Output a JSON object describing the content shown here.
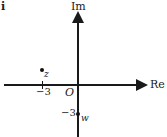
{
  "figure": {
    "part_label": "i",
    "width": 167,
    "height": 137,
    "background_color": "#ffffff",
    "ink_color": "#1a1a1a"
  },
  "axes": {
    "imaginary_label": "Im",
    "real_label": "Re",
    "origin_label": "O"
  },
  "ticks": {
    "real_minus_three": "−3",
    "imaginary_minus_three": "−3"
  },
  "points": [
    {
      "label": "z",
      "real": -3,
      "imaginary": 1,
      "marker": "filled-dot"
    },
    {
      "label": "w",
      "real": 0,
      "imaginary": -3,
      "marker": "filled-dot"
    }
  ],
  "chart_data": {
    "type": "scatter",
    "title": "",
    "subtitle": "",
    "xlabel": "Re",
    "ylabel": "Im",
    "xlim": [
      -5.2,
      5.0
    ],
    "ylim": [
      -4.8,
      4.5
    ],
    "grid": false,
    "legend": null,
    "xticks": [
      -3
    ],
    "xticklabels": [
      "−3"
    ],
    "yticks": [
      -3
    ],
    "yticklabels": [
      "−3"
    ],
    "annotations": [
      "O",
      "z",
      "w",
      "i"
    ],
    "series": [
      {
        "name": "z",
        "x": [
          -3
        ],
        "y": [
          1
        ]
      },
      {
        "name": "w",
        "x": [
          0
        ],
        "y": [
          -3
        ]
      }
    ]
  }
}
